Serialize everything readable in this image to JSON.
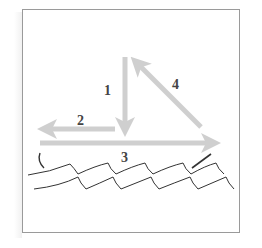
{
  "diagram": {
    "type": "force/vector diagram over water",
    "colors": {
      "frame_border": "#9a9a9a",
      "arrow": "#cfcfcf",
      "label": "#444444",
      "wave_line": "#333333"
    },
    "arrows": [
      {
        "id": 1,
        "label": "1",
        "direction": "down",
        "from": [
          125,
          57
        ],
        "to": [
          125,
          136
        ]
      },
      {
        "id": 2,
        "label": "2",
        "direction": "left",
        "from": [
          115,
          129
        ],
        "to": [
          38,
          129
        ]
      },
      {
        "id": 3,
        "label": "3",
        "direction": "right",
        "from": [
          40,
          143
        ],
        "to": [
          221,
          143
        ]
      },
      {
        "id": 4,
        "label": "4",
        "direction": "up-left",
        "from": [
          201,
          127
        ],
        "to": [
          131,
          57
        ]
      }
    ],
    "labels": {
      "arrow1": "1",
      "arrow2": "2",
      "arrow3": "3",
      "arrow4": "4"
    },
    "water": {
      "rows": 2,
      "description": "scalloped wave lines"
    }
  }
}
